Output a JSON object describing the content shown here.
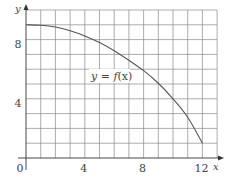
{
  "chart_data": {
    "type": "line",
    "title": "",
    "xlabel": "x",
    "ylabel": "y",
    "xlim": [
      0,
      13
    ],
    "ylim": [
      0,
      10
    ],
    "grid": true,
    "grid_step": 1,
    "x_ticks": [
      0,
      4,
      8,
      12
    ],
    "x_tick_labels": [
      "0",
      "4",
      "8",
      "12"
    ],
    "y_ticks": [
      4,
      8
    ],
    "y_tick_labels": [
      "4",
      "8"
    ],
    "annotations": [
      {
        "text": "y = f(x)",
        "x": 6.4,
        "y": 5.5
      }
    ],
    "series": [
      {
        "name": "y = f(x)",
        "x": [
          0,
          1,
          2,
          3,
          4,
          5,
          6,
          7,
          8,
          9,
          10,
          11,
          12
        ],
        "values": [
          9.0,
          8.97,
          8.85,
          8.6,
          8.25,
          7.8,
          7.25,
          6.6,
          5.9,
          5.05,
          4.0,
          2.75,
          1.0
        ]
      }
    ]
  },
  "labels": {
    "x_axis": "x",
    "y_axis": "y",
    "origin": "0",
    "curve_label_y": "y",
    "curve_label_eq": " = ",
    "curve_label_f": "f",
    "curve_label_arg": "(x)"
  },
  "colors": {
    "grid": "#8a8a8a",
    "axis": "#333333",
    "curve": "#555555",
    "text": "#444444"
  }
}
